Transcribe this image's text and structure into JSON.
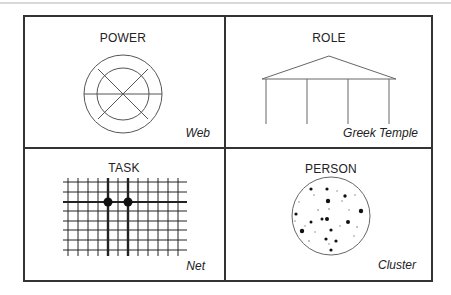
{
  "panels": [
    {
      "title": "POWER",
      "caption": "Web",
      "figure": "concentric-circles-with-spokes"
    },
    {
      "title": "ROLE",
      "caption": "Greek Temple",
      "figure": "temple-roof-and-columns"
    },
    {
      "title": "TASK",
      "caption": "Net",
      "figure": "grid-with-two-nodes"
    },
    {
      "title": "PERSON",
      "caption": "Cluster",
      "figure": "circle-with-scattered-dots"
    }
  ],
  "colors": {
    "line": "#333333",
    "figure": "#555555",
    "background": "#ffffff"
  }
}
